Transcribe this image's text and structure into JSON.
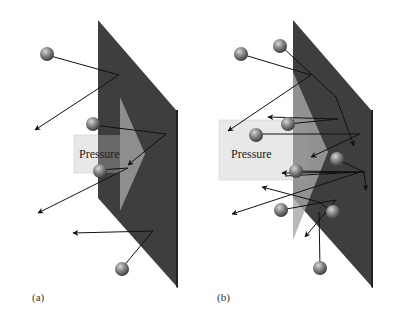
{
  "figure": {
    "panels": [
      {
        "id": "a",
        "caption": "(a)",
        "arrow_label": "Pressure",
        "description": "Few gas molecules striking a wall and rebounding"
      },
      {
        "id": "b",
        "caption": "(b)",
        "arrow_label": "Pressure",
        "description": "Many gas molecules striking a wall and rebounding, larger pressure"
      }
    ],
    "colors": {
      "wall": "#3c3c3c",
      "wall_edge": "#2a2a2a",
      "pressure_box": "#e6e6e6",
      "pressure_arrow": "#9a9a9a",
      "molecule": "#7a7a7a",
      "trajectory": "#111111"
    }
  }
}
